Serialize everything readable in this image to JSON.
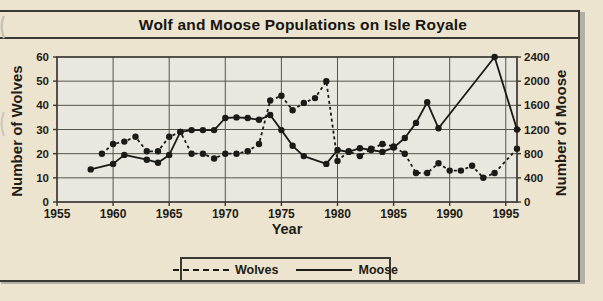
{
  "figure": {
    "title": "Wolf and Moose Populations on Isle Royale",
    "colors": {
      "page_background": "#ece4cf",
      "plot_background": "#e9e7e0",
      "line_color": "#1c1a16",
      "grid_color": "#565349",
      "border_color": "#3a3833",
      "shadow_color": "#b2afa5"
    }
  },
  "chart_data": {
    "type": "line",
    "title": "Wolf and Moose Populations on Isle Royale",
    "xlabel": "Year",
    "ylabel_left": "Number of Wolves",
    "ylabel_right": "Number of Moose",
    "x_range": [
      1955,
      1996
    ],
    "y_left_range": [
      0,
      60
    ],
    "y_right_range": [
      0,
      2400
    ],
    "x_ticks": [
      1955,
      1960,
      1965,
      1970,
      1975,
      1980,
      1985,
      1990,
      1995
    ],
    "y_left_ticks": [
      0,
      10,
      20,
      30,
      40,
      50,
      60
    ],
    "y_right_ticks": [
      0,
      400,
      800,
      1200,
      1600,
      2000,
      2400
    ],
    "grid": true,
    "legend_position": "bottom",
    "series": [
      {
        "name": "Wolves",
        "axis": "left",
        "line_style": "dashed",
        "marker": "circle",
        "points": [
          [
            1959,
            20
          ],
          [
            1960,
            24
          ],
          [
            1961,
            25
          ],
          [
            1962,
            27
          ],
          [
            1963,
            21
          ],
          [
            1964,
            21
          ],
          [
            1965,
            27
          ],
          [
            1966,
            29
          ],
          [
            1967,
            20
          ],
          [
            1968,
            20
          ],
          [
            1969,
            18
          ],
          [
            1970,
            20
          ],
          [
            1971,
            20
          ],
          [
            1972,
            21
          ],
          [
            1973,
            24
          ],
          [
            1974,
            42
          ],
          [
            1975,
            44
          ],
          [
            1976,
            38
          ],
          [
            1977,
            41
          ],
          [
            1978,
            43
          ],
          [
            1979,
            50
          ],
          [
            1980,
            17
          ],
          [
            1981,
            21
          ],
          [
            1982,
            19
          ],
          [
            1983,
            22
          ],
          [
            1984,
            24
          ],
          [
            1985,
            23
          ],
          [
            1986,
            20
          ],
          [
            1987,
            12
          ],
          [
            1988,
            12
          ],
          [
            1989,
            16
          ],
          [
            1990,
            13
          ],
          [
            1991,
            13
          ],
          [
            1992,
            15
          ],
          [
            1993,
            10
          ],
          [
            1994,
            12
          ],
          [
            1996,
            22
          ]
        ]
      },
      {
        "name": "Moose",
        "axis": "right",
        "line_style": "solid",
        "marker": "circle",
        "points": [
          [
            1958,
            540
          ],
          [
            1960,
            630
          ],
          [
            1961,
            780
          ],
          [
            1963,
            700
          ],
          [
            1964,
            650
          ],
          [
            1965,
            780
          ],
          [
            1966,
            1160
          ],
          [
            1967,
            1190
          ],
          [
            1968,
            1190
          ],
          [
            1969,
            1190
          ],
          [
            1970,
            1390
          ],
          [
            1971,
            1400
          ],
          [
            1972,
            1390
          ],
          [
            1973,
            1360
          ],
          [
            1974,
            1440
          ],
          [
            1975,
            1190
          ],
          [
            1976,
            930
          ],
          [
            1977,
            760
          ],
          [
            1979,
            630
          ],
          [
            1980,
            860
          ],
          [
            1981,
            830
          ],
          [
            1982,
            890
          ],
          [
            1983,
            860
          ],
          [
            1984,
            830
          ],
          [
            1985,
            900
          ],
          [
            1986,
            1060
          ],
          [
            1987,
            1310
          ],
          [
            1988,
            1650
          ],
          [
            1989,
            1220
          ],
          [
            1994,
            2400
          ],
          [
            1996,
            1200
          ]
        ]
      }
    ]
  }
}
